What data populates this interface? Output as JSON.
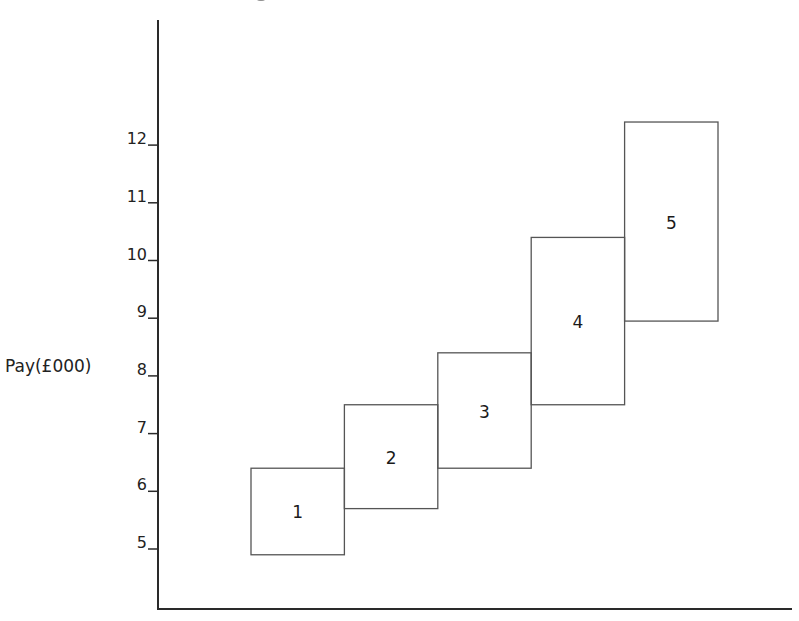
{
  "chart_data": {
    "type": "bar",
    "subtype": "floating-range-boxes",
    "title": "",
    "xlabel": "",
    "ylabel": "Pay (£000)",
    "ylim": [
      4,
      13.3
    ],
    "yticks": [
      5,
      6,
      7,
      8,
      9,
      10,
      11,
      12
    ],
    "grid": false,
    "legend": null,
    "categories": [
      "1",
      "2",
      "3",
      "4",
      "5"
    ],
    "series": [
      {
        "name": "min",
        "values": [
          4.9,
          5.7,
          6.4,
          7.5,
          8.95
        ]
      },
      {
        "name": "max",
        "values": [
          6.4,
          7.5,
          8.4,
          10.4,
          12.4
        ]
      }
    ],
    "boxes": [
      {
        "label": "1",
        "min": 4.9,
        "max": 6.4
      },
      {
        "label": "2",
        "min": 5.7,
        "max": 7.5
      },
      {
        "label": "3",
        "min": 6.4,
        "max": 8.4
      },
      {
        "label": "4",
        "min": 7.5,
        "max": 10.4
      },
      {
        "label": "5",
        "min": 8.95,
        "max": 12.4
      }
    ]
  },
  "axis": {
    "y_label": "Pay(£000)",
    "ticks": [
      "5",
      "6",
      "7",
      "8",
      "9",
      "10",
      "11",
      "12"
    ]
  },
  "colors": {
    "line": "#333333",
    "box_stroke": "#555555",
    "background": "#ffffff"
  }
}
